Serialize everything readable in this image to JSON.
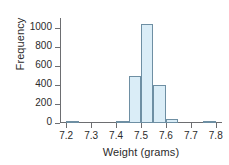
{
  "chart_data": {
    "type": "bar",
    "title": "",
    "subtitle": "",
    "xlabel": "Weight (grams)",
    "ylabel": "Frequency",
    "xlim": [
      7.175,
      7.825
    ],
    "ylim": [
      0,
      1100
    ],
    "grid": false,
    "legend": null,
    "bin_width": 0.05,
    "xticks": [
      "7.2",
      "7.3",
      "7.4",
      "7.5",
      "7.6",
      "7.7",
      "7.8"
    ],
    "xtick_values": [
      7.2,
      7.3,
      7.4,
      7.5,
      7.6,
      7.7,
      7.8
    ],
    "yticks": [
      "0",
      "200",
      "400",
      "600",
      "800",
      "1000"
    ],
    "ytick_values": [
      0,
      200,
      400,
      600,
      800,
      1000
    ],
    "bins": [
      {
        "x0": 7.2,
        "x1": 7.25,
        "value": 10
      },
      {
        "x0": 7.4,
        "x1": 7.45,
        "value": 10
      },
      {
        "x0": 7.45,
        "x1": 7.475,
        "value": 40
      },
      {
        "x0": 7.45,
        "x1": 7.5,
        "value": 490
      },
      {
        "x0": 7.5,
        "x1": 7.55,
        "value": 1040
      },
      {
        "x0": 7.55,
        "x1": 7.6,
        "value": 400
      },
      {
        "x0": 7.6,
        "x1": 7.65,
        "value": 40
      },
      {
        "x0": 7.75,
        "x1": 7.8,
        "value": 10
      }
    ],
    "categories": [
      "7.20-7.25",
      "7.40-7.45",
      "7.45-7.50",
      "7.50-7.55",
      "7.55-7.60",
      "7.60-7.65",
      "7.75-7.80"
    ],
    "values": [
      10,
      10,
      490,
      1040,
      400,
      40,
      10
    ],
    "colors": {
      "bar_fill": "#daedf7",
      "bar_border": "#6e8fa3",
      "axis": "#6d6e71",
      "text": "#2b2b2b",
      "background": "#ffffff"
    }
  }
}
